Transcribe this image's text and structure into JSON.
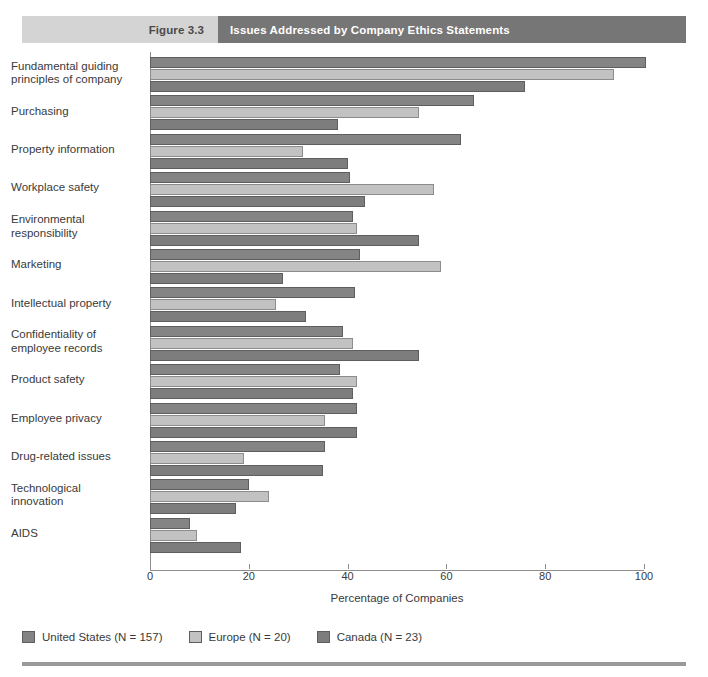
{
  "header": {
    "figure_number": "Figure 3.3",
    "title": "Issues Addressed by Company Ethics Statements"
  },
  "chart_data": {
    "type": "bar",
    "orientation": "horizontal",
    "title": "Issues Addressed by Company Ethics Statements",
    "xlabel": "Percentage of Companies",
    "ylabel": "",
    "xlim": [
      0,
      100
    ],
    "xticks": [
      0,
      20,
      40,
      60,
      80,
      100
    ],
    "grid": false,
    "legend_position": "bottom-left",
    "categories": [
      "Fundamental guiding principles of company",
      "Purchasing",
      "Property information",
      "Workplace safety",
      "Environmental responsibility",
      "Marketing",
      "Intellectual property",
      "Confidentiality of employee records",
      "Product safety",
      "Employee privacy",
      "Drug-related issues",
      "Technological innovation",
      "AIDS"
    ],
    "series": [
      {
        "name": "United States (N = 157)",
        "color": "#848484",
        "values": [
          100.5,
          65.5,
          63,
          40.5,
          41,
          42.5,
          41.5,
          39,
          38.5,
          42,
          35.5,
          20,
          8
        ]
      },
      {
        "name": "Europe (N = 20)",
        "color": "#c2c2c2",
        "values": [
          94,
          54.5,
          31,
          57.5,
          42,
          59,
          25.5,
          41,
          42,
          35.5,
          19,
          24,
          9.5
        ]
      },
      {
        "name": "Canada (N = 23)",
        "color": "#7d7d7d",
        "values": [
          76,
          38,
          40,
          43.5,
          54.5,
          27,
          31.5,
          54.5,
          41,
          42,
          35,
          17.5,
          18.5
        ]
      }
    ]
  }
}
